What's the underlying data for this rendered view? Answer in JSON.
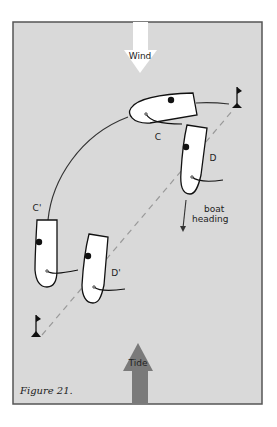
{
  "figure": {
    "caption": "Figure 21.",
    "background_color": "#d9d9d9",
    "frame_color": "#555555"
  },
  "arrows": {
    "wind": {
      "label": "Wind",
      "color": "#ffffff"
    },
    "tide": {
      "label": "Tide",
      "color": "#7a7a7a"
    },
    "heading": {
      "label_line1": "boat",
      "label_line2": "heading"
    }
  },
  "boats": [
    {
      "id": "C",
      "label": "C"
    },
    {
      "id": "D",
      "label": "D"
    },
    {
      "id": "C-prime",
      "label": "C'"
    },
    {
      "id": "D-prime",
      "label": "D'"
    }
  ],
  "marks": {
    "upper": "mark-flag",
    "lower": "mark-flag"
  }
}
